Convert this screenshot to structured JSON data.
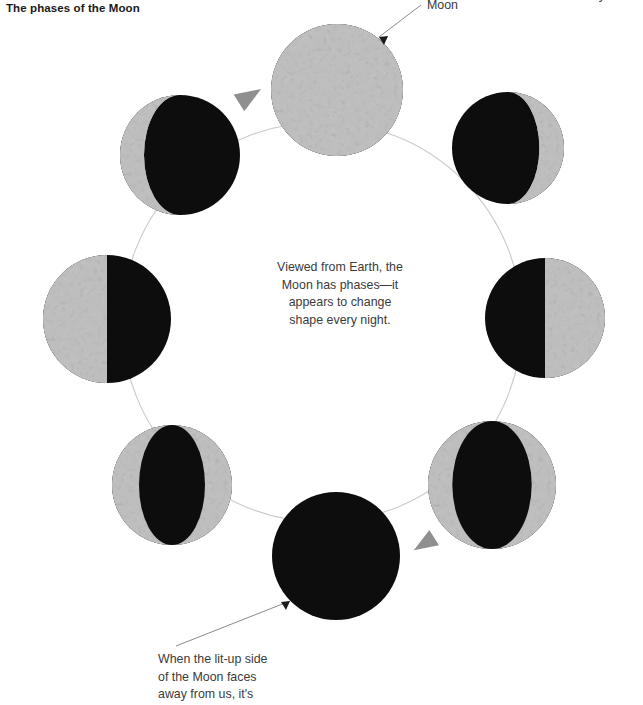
{
  "title": "The phases of the Moon",
  "annotations": {
    "moon_label": "Moon",
    "center_text": "Viewed from Earth, the\nMoon has phases—it\nappears to change\nshape every night.",
    "bottom_caption": "When the lit-up side\nof the Moon faces\naway from us, it's",
    "top_right_caption": "each year."
  },
  "colors": {
    "background": "#ffffff",
    "moon_lit": "#8c8c8c",
    "moon_lit_highlight": "#b9b9b9",
    "moon_lit_crater": "#5d5d5d",
    "moon_dark": "#0d0d0d",
    "orbit_line": "#c9c9c9",
    "arrow_fill": "#8f8f8f",
    "leader_line": "#8a8a8a",
    "title_text": "#1a1a1a",
    "body_text": "#3b3b3b"
  },
  "orbit": {
    "center_x": 322,
    "center_y": 322,
    "radius": 200,
    "direction": "counterclockwise"
  },
  "direction_arrows": [
    {
      "name": "orbit-arrow-top",
      "x": 250,
      "y": 96,
      "rotation": -30
    },
    {
      "name": "orbit-arrow-bottom",
      "x": 424,
      "y": 544,
      "rotation": 150
    }
  ],
  "phases": [
    {
      "name": "full-moon",
      "label": "Full Moon",
      "cx": 337,
      "cy": 90,
      "r": 66,
      "lit_fraction": 1.0,
      "lit_side": "full"
    },
    {
      "name": "waning-gibbous",
      "label": "Waning Gibbous",
      "cx": 508,
      "cy": 148,
      "r": 56,
      "lit_fraction": 0.78,
      "lit_side": "right"
    },
    {
      "name": "third-quarter",
      "label": "Third Quarter",
      "cx": 545,
      "cy": 318,
      "r": 60,
      "lit_fraction": 0.5,
      "lit_side": "right"
    },
    {
      "name": "waning-crescent",
      "label": "Waning Crescent",
      "cx": 492,
      "cy": 485,
      "r": 64,
      "lit_fraction": 0.2,
      "lit_side": "right"
    },
    {
      "name": "new-moon",
      "label": "New Moon",
      "cx": 336,
      "cy": 556,
      "r": 64,
      "lit_fraction": 0.0,
      "lit_side": "none"
    },
    {
      "name": "waxing-crescent",
      "label": "Waxing Crescent",
      "cx": 172,
      "cy": 485,
      "r": 60,
      "lit_fraction": 0.24,
      "lit_side": "left"
    },
    {
      "name": "first-quarter",
      "label": "First Quarter",
      "cx": 107,
      "cy": 319,
      "r": 64,
      "lit_fraction": 0.5,
      "lit_side": "left"
    },
    {
      "name": "waxing-gibbous",
      "label": "Waxing Gibbous",
      "cx": 180,
      "cy": 155,
      "r": 60,
      "lit_fraction": 0.8,
      "lit_side": "left"
    }
  ],
  "leader_lines": [
    {
      "name": "moon-label-leader",
      "x1": 421,
      "y1": 5,
      "x2": 376,
      "y2": 40
    },
    {
      "name": "caption-leader",
      "x1": 178,
      "y1": 645,
      "x2": 292,
      "y2": 600
    }
  ]
}
